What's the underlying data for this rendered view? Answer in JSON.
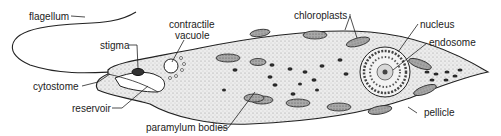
{
  "diagram": {
    "labels": {
      "flagellum": "flagellum",
      "contractile_vacuole_line1": "contractile",
      "contractile_vacuole_line2": "vacuole",
      "stigma": "stigma",
      "cytostome": "cytostome",
      "reservoir": "reservoir",
      "paramylum_bodies": "paramylum bodies",
      "chloroplasts": "chloroplasts",
      "nucleus": "nucleus",
      "endosome": "endosome",
      "pellicle": "pellicle"
    },
    "colors": {
      "line": "#222222",
      "cell_fill": "#e6e6e6",
      "chloroplast_fill": "#9a9a9a",
      "paramylum_fill": "#2a2a2a"
    }
  }
}
